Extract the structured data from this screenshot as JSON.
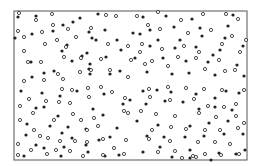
{
  "chart_data": {
    "type": "scatter",
    "title": "",
    "xlabel": "",
    "ylabel": "",
    "grid": false,
    "legend": null,
    "frame": {
      "x": 14,
      "y": 11,
      "width": 233,
      "height": 149,
      "stroke": "#555555"
    },
    "marker_radius": 1.6,
    "series": [
      {
        "name": "filled",
        "style": "filled",
        "color": "#222222",
        "points": [
          [
            18,
            17
          ],
          [
            36,
            16
          ],
          [
            98,
            14
          ],
          [
            80,
            18
          ],
          [
            63,
            25
          ],
          [
            32,
            34
          ],
          [
            73,
            22
          ],
          [
            15,
            38
          ],
          [
            53,
            31
          ],
          [
            105,
            30
          ],
          [
            89,
            32
          ],
          [
            67,
            45
          ],
          [
            62,
            51
          ],
          [
            92,
            38
          ],
          [
            96,
            40
          ],
          [
            121,
            50
          ],
          [
            87,
            53
          ],
          [
            72,
            61
          ],
          [
            31,
            62
          ],
          [
            90,
            64
          ],
          [
            89,
            69
          ],
          [
            32,
            77
          ],
          [
            44,
            73
          ],
          [
            54,
            71
          ],
          [
            90,
            74
          ],
          [
            120,
            71
          ],
          [
            110,
            74
          ],
          [
            106,
            57
          ],
          [
            82,
            56
          ],
          [
            117,
            40
          ],
          [
            143,
            17
          ],
          [
            166,
            16
          ],
          [
            192,
            19
          ],
          [
            233,
            15
          ],
          [
            150,
            30
          ],
          [
            174,
            27
          ],
          [
            133,
            33
          ],
          [
            140,
            34
          ],
          [
            202,
            36
          ],
          [
            225,
            38
          ],
          [
            150,
            46
          ],
          [
            175,
            48
          ],
          [
            196,
            47
          ],
          [
            220,
            50
          ],
          [
            163,
            58
          ],
          [
            186,
            61
          ],
          [
            208,
            62
          ],
          [
            237,
            65
          ],
          [
            147,
            72
          ],
          [
            172,
            74
          ],
          [
            189,
            73
          ],
          [
            215,
            75
          ],
          [
            244,
            76
          ],
          [
            158,
            40
          ],
          [
            135,
            58
          ],
          [
            228,
            26
          ],
          [
            243,
            46
          ],
          [
            200,
            28
          ],
          [
            180,
            40
          ],
          [
            213,
            55
          ],
          [
            21,
            91
          ],
          [
            42,
            93
          ],
          [
            60,
            96
          ],
          [
            77,
            91
          ],
          [
            104,
            94
          ],
          [
            36,
            108
          ],
          [
            44,
            107
          ],
          [
            58,
            116
          ],
          [
            93,
            109
          ],
          [
            103,
            115
          ],
          [
            123,
            104
          ],
          [
            27,
            124
          ],
          [
            50,
            126
          ],
          [
            68,
            127
          ],
          [
            86,
            129
          ],
          [
            117,
            128
          ],
          [
            26,
            135
          ],
          [
            62,
            133
          ],
          [
            72,
            138
          ],
          [
            99,
            140
          ],
          [
            110,
            137
          ],
          [
            36,
            145
          ],
          [
            44,
            148
          ],
          [
            64,
            147
          ],
          [
            86,
            145
          ],
          [
            24,
            156
          ],
          [
            61,
            156
          ],
          [
            105,
            156
          ],
          [
            119,
            155
          ],
          [
            88,
            152
          ],
          [
            143,
            91
          ],
          [
            157,
            90
          ],
          [
            171,
            92
          ],
          [
            196,
            94
          ],
          [
            215,
            98
          ],
          [
            226,
            91
          ],
          [
            239,
            93
          ],
          [
            146,
            104
          ],
          [
            165,
            101
          ],
          [
            183,
            102
          ],
          [
            199,
            109
          ],
          [
            215,
            107
          ],
          [
            232,
            110
          ],
          [
            137,
            121
          ],
          [
            158,
            125
          ],
          [
            190,
            126
          ],
          [
            209,
            123
          ],
          [
            228,
            121
          ],
          [
            243,
            134
          ],
          [
            147,
            136
          ],
          [
            164,
            137
          ],
          [
            185,
            137
          ],
          [
            204,
            136
          ],
          [
            224,
            134
          ],
          [
            143,
            152
          ],
          [
            160,
            147
          ],
          [
            190,
            150
          ],
          [
            219,
            153
          ],
          [
            236,
            154
          ],
          [
            172,
            157
          ],
          [
            190,
            158
          ],
          [
            211,
            160
          ],
          [
            130,
            100
          ],
          [
            245,
            150
          ]
        ]
      },
      {
        "name": "open",
        "style": "open",
        "color": "#222222",
        "points": [
          [
            19,
            13
          ],
          [
            52,
            14
          ],
          [
            36,
            20
          ],
          [
            106,
            15
          ],
          [
            116,
            16
          ],
          [
            53,
            25
          ],
          [
            68,
            29
          ],
          [
            18,
            31
          ],
          [
            42,
            32
          ],
          [
            24,
            37
          ],
          [
            45,
            44
          ],
          [
            76,
            37
          ],
          [
            57,
            40
          ],
          [
            91,
            28
          ],
          [
            108,
            44
          ],
          [
            128,
            46
          ],
          [
            66,
            47
          ],
          [
            24,
            51
          ],
          [
            64,
            57
          ],
          [
            81,
            58
          ],
          [
            101,
            59
          ],
          [
            28,
            62
          ],
          [
            41,
            62
          ],
          [
            80,
            72
          ],
          [
            110,
            70
          ],
          [
            58,
            74
          ],
          [
            63,
            79
          ],
          [
            24,
            81
          ],
          [
            44,
            80
          ],
          [
            91,
            70
          ],
          [
            137,
            16
          ],
          [
            158,
            12
          ],
          [
            181,
            20
          ],
          [
            203,
            14
          ],
          [
            226,
            14
          ],
          [
            238,
            19
          ],
          [
            148,
            25
          ],
          [
            160,
            29
          ],
          [
            188,
            33
          ],
          [
            211,
            30
          ],
          [
            232,
            36
          ],
          [
            142,
            44
          ],
          [
            162,
            49
          ],
          [
            184,
            46
          ],
          [
            199,
            52
          ],
          [
            222,
            44
          ],
          [
            240,
            52
          ],
          [
            131,
            60
          ],
          [
            152,
            61
          ],
          [
            178,
            57
          ],
          [
            196,
            58
          ],
          [
            219,
            60
          ],
          [
            235,
            70
          ],
          [
            145,
            64
          ],
          [
            168,
            66
          ],
          [
            205,
            69
          ],
          [
            225,
            71
          ],
          [
            140,
            52
          ],
          [
            246,
            40
          ],
          [
            128,
            77
          ],
          [
            62,
            89
          ],
          [
            72,
            90
          ],
          [
            88,
            88
          ],
          [
            101,
            87
          ],
          [
            29,
            99
          ],
          [
            46,
            101
          ],
          [
            59,
            102
          ],
          [
            70,
            103
          ],
          [
            89,
            97
          ],
          [
            112,
            92
          ],
          [
            20,
            106
          ],
          [
            33,
            113
          ],
          [
            54,
            120
          ],
          [
            73,
            114
          ],
          [
            81,
            120
          ],
          [
            87,
            130
          ],
          [
            98,
            126
          ],
          [
            125,
            98
          ],
          [
            124,
            111
          ],
          [
            128,
            113
          ],
          [
            40,
            136
          ],
          [
            48,
            138
          ],
          [
            60,
            141
          ],
          [
            75,
            141
          ],
          [
            87,
            142
          ],
          [
            103,
            139
          ],
          [
            18,
            144
          ],
          [
            31,
            150
          ],
          [
            56,
            150
          ],
          [
            70,
            151
          ],
          [
            18,
            155
          ],
          [
            47,
            154
          ],
          [
            83,
            156
          ],
          [
            103,
            155
          ],
          [
            124,
            154
          ],
          [
            114,
            148
          ],
          [
            126,
            140
          ],
          [
            34,
            130
          ],
          [
            94,
            118
          ],
          [
            20,
            120
          ],
          [
            149,
            89
          ],
          [
            168,
            87
          ],
          [
            186,
            88
          ],
          [
            204,
            89
          ],
          [
            222,
            90
          ],
          [
            244,
            90
          ],
          [
            150,
            97
          ],
          [
            170,
            100
          ],
          [
            194,
            99
          ],
          [
            208,
            106
          ],
          [
            224,
            107
          ],
          [
            236,
            104
          ],
          [
            141,
            111
          ],
          [
            156,
            114
          ],
          [
            175,
            116
          ],
          [
            199,
            113
          ],
          [
            216,
            117
          ],
          [
            236,
            116
          ],
          [
            152,
            130
          ],
          [
            171,
            127
          ],
          [
            186,
            129
          ],
          [
            205,
            130
          ],
          [
            220,
            130
          ],
          [
            238,
            128
          ],
          [
            149,
            139
          ],
          [
            170,
            141
          ],
          [
            198,
            142
          ],
          [
            215,
            142
          ],
          [
            230,
            144
          ],
          [
            158,
            152
          ],
          [
            175,
            151
          ],
          [
            193,
            156
          ],
          [
            205,
            154
          ],
          [
            221,
            155
          ],
          [
            239,
            154
          ],
          [
            182,
            158
          ],
          [
            196,
            157
          ],
          [
            244,
            123
          ]
        ]
      }
    ]
  }
}
